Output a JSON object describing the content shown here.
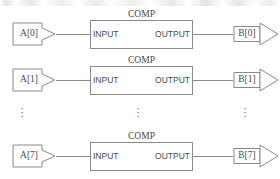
{
  "figure": {
    "stroke_color": "#8a8a8a",
    "text_color": "#4a4a4a",
    "background": "#ffffff"
  },
  "block": {
    "name": "COMP",
    "input_port": "INPUT",
    "output_port": "OUTPUT"
  },
  "rows": [
    {
      "index": "0",
      "source_label": "A[0]",
      "block_label": "COMP",
      "input_label": "INPUT",
      "output_label": "OUTPUT",
      "dest_label": "B[0]"
    },
    {
      "index": "1",
      "source_label": "A[1]",
      "block_label": "COMP",
      "input_label": "INPUT",
      "output_label": "OUTPUT",
      "dest_label": "B[1]"
    },
    {
      "index": "7",
      "source_label": "A[7]",
      "block_label": "COMP",
      "input_label": "INPUT",
      "output_label": "OUTPUT",
      "dest_label": "B[7]"
    }
  ],
  "ellipsis": {
    "glyph": "⋮",
    "dot": "·",
    "columns": [
      "source",
      "block",
      "dest"
    ]
  }
}
